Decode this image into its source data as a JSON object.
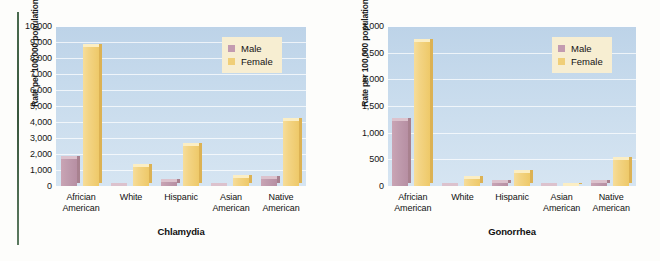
{
  "figure": {
    "background_color": "#fdfdfb",
    "rule_color": "#3f6144"
  },
  "chart_data": [
    {
      "type": "bar",
      "title": "Chlamydia",
      "xlabel": "",
      "ylabel": "Rate per 100,000 population",
      "ylim": [
        0,
        10000
      ],
      "ytick_labels": [
        "10,000",
        "9,000",
        "8,000",
        "7,000",
        "6,000",
        "5,000",
        "4,000",
        "3,000",
        "2,000",
        "1,000",
        "0"
      ],
      "ytick_values": [
        10000,
        9000,
        8000,
        7000,
        6000,
        5000,
        4000,
        3000,
        2000,
        1000,
        0
      ],
      "grid": true,
      "legend_position": "top-right",
      "categories": [
        {
          "line1": "Africian",
          "line2": "American"
        },
        {
          "line1": "White",
          "line2": ""
        },
        {
          "line1": "Hispanic",
          "line2": ""
        },
        {
          "line1": "Asian",
          "line2": "American"
        },
        {
          "line1": "Native",
          "line2": "American"
        }
      ],
      "series": [
        {
          "name": "Male",
          "color": "#c39bb0",
          "values": [
            1850,
            170,
            440,
            100,
            650
          ]
        },
        {
          "name": "Female",
          "color": "#f0cf79",
          "values": [
            8900,
            1400,
            2700,
            700,
            4250
          ]
        }
      ]
    },
    {
      "type": "bar",
      "title": "Gonorrhea",
      "xlabel": "",
      "ylabel": "Rate per 100,000 population",
      "ylim": [
        0,
        3000
      ],
      "ytick_labels": [
        "3,000",
        "2,500",
        "2,000",
        "1,500",
        "1,000",
        "500",
        "0"
      ],
      "ytick_values": [
        3000,
        2500,
        2000,
        1500,
        1000,
        500,
        0
      ],
      "grid": true,
      "legend_position": "top-right",
      "categories": [
        {
          "line1": "Africian",
          "line2": "American"
        },
        {
          "line1": "White",
          "line2": ""
        },
        {
          "line1": "Hispanic",
          "line2": ""
        },
        {
          "line1": "Asian",
          "line2": "American"
        },
        {
          "line1": "Native",
          "line2": "American"
        }
      ],
      "series": [
        {
          "name": "Male",
          "color": "#c39bb0",
          "values": [
            1280,
            45,
            110,
            20,
            110
          ]
        },
        {
          "name": "Female",
          "color": "#f0cf79",
          "values": [
            2750,
            180,
            300,
            65,
            540
          ]
        }
      ]
    }
  ]
}
